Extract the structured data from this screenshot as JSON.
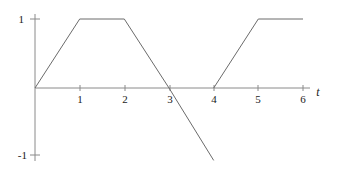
{
  "figure": {
    "background": "#ffffff",
    "line_color": "#6b6b6b",
    "axis_color": "#8a8a8a",
    "text_color": "#1a1a1a"
  },
  "axes": {
    "x_axis_variable": "t",
    "x_ticks": [
      "1",
      "2",
      "3",
      "4",
      "5",
      "6"
    ],
    "y_ticks": [
      "1",
      "-1"
    ],
    "x_range": [
      0,
      6.2
    ],
    "y_range": [
      -1.12,
      1.15
    ]
  },
  "chart_data": {
    "type": "line",
    "title": "",
    "xlabel": "t",
    "ylabel": "",
    "xlim": [
      0,
      6.2
    ],
    "ylim": [
      -1.12,
      1.15
    ],
    "grid": false,
    "legend": "none",
    "x_tick_values": [
      1,
      2,
      3,
      4,
      5,
      6
    ],
    "x_tick_labels": [
      "1",
      "2",
      "3",
      "4",
      "5",
      "6"
    ],
    "y_tick_values": [
      1,
      -1
    ],
    "y_tick_labels": [
      "1",
      "-1"
    ],
    "series": [
      {
        "name": "segment-1",
        "comment": "ramp up, plateau at 1, ramp down through zero at t=3, continues below -1",
        "points": [
          [
            0,
            0
          ],
          [
            1,
            1
          ],
          [
            2,
            1
          ],
          [
            3,
            0
          ],
          [
            4,
            -1.05
          ]
        ]
      },
      {
        "name": "segment-2",
        "comment": "second ramp from zero at t=4 up to 1 at t=5, plateau to t=6",
        "points": [
          [
            4,
            0
          ],
          [
            5,
            1
          ],
          [
            6,
            1
          ]
        ]
      }
    ]
  }
}
